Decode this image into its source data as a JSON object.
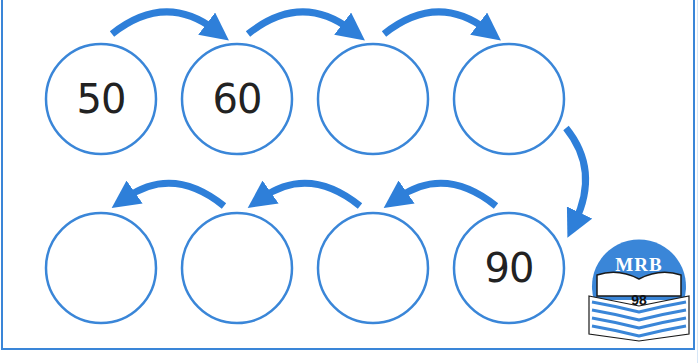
{
  "worksheet": {
    "title": "Counting by tens number sequence",
    "circles_top": [
      {
        "value": "50"
      },
      {
        "value": "60"
      },
      {
        "value": ""
      },
      {
        "value": ""
      }
    ],
    "circles_bottom": [
      {
        "value": ""
      },
      {
        "value": ""
      },
      {
        "value": ""
      },
      {
        "value": "90"
      }
    ]
  },
  "badge": {
    "title": "MRB",
    "page": "98"
  },
  "colors": {
    "accent": "#3a86d8",
    "arrow": "#2e7fd9",
    "text": "#222222"
  }
}
